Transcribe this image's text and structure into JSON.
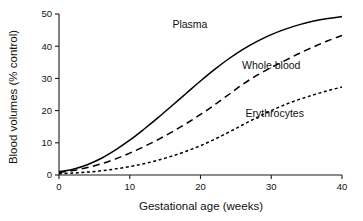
{
  "chart_data": {
    "type": "line",
    "title": "",
    "xlabel": "Gestational age (weeks)",
    "ylabel": "Blood volumes (% control)",
    "xlim": [
      0,
      40
    ],
    "ylim": [
      0,
      50
    ],
    "grid": false,
    "legend_position": "inline-annotations",
    "xticks": [
      "0",
      "10",
      "20",
      "30",
      "40"
    ],
    "xtick_values": [
      0,
      10,
      20,
      30,
      40
    ],
    "yticks": [
      "0",
      "10",
      "20",
      "30",
      "40",
      "50"
    ],
    "ytick_values": [
      0,
      10,
      20,
      30,
      40,
      50
    ],
    "x": [
      0,
      2,
      4,
      6,
      8,
      10,
      12,
      14,
      16,
      18,
      20,
      22,
      24,
      26,
      28,
      30,
      32,
      34,
      36,
      38,
      40
    ],
    "series": [
      {
        "name": "Plasma",
        "style": "solid",
        "values": [
          1.0,
          1.8,
          3.2,
          5.2,
          7.8,
          10.8,
          14.2,
          17.8,
          21.6,
          25.4,
          29.2,
          32.8,
          36.1,
          39.0,
          41.5,
          43.6,
          45.3,
          46.7,
          47.8,
          48.6,
          49.2
        ],
        "label_position": {
          "x": 18.5,
          "y": 45.5
        }
      },
      {
        "name": "Whole blood",
        "style": "dashed",
        "values": [
          0.8,
          1.4,
          2.3,
          3.5,
          5.0,
          6.8,
          8.8,
          11.0,
          13.4,
          16.0,
          18.8,
          21.8,
          25.0,
          28.2,
          31.0,
          33.4,
          35.6,
          37.8,
          39.8,
          41.7,
          43.3
        ],
        "label_position": {
          "x": 30.0,
          "y": 33.0
        }
      },
      {
        "name": "Erythrocytes",
        "style": "dotted",
        "values": [
          0.4,
          0.6,
          0.9,
          1.3,
          1.9,
          2.6,
          3.5,
          4.6,
          5.9,
          7.4,
          9.1,
          11.1,
          13.3,
          15.6,
          17.9,
          20.0,
          21.9,
          23.5,
          24.9,
          26.2,
          27.3
        ],
        "label_position": {
          "x": 30.5,
          "y": 18.0
        }
      }
    ]
  },
  "axes": {
    "x_title": "Gestational age (weeks)",
    "y_title": "Blood volumes (% control)",
    "x_ticks": [
      "0",
      "10",
      "20",
      "30",
      "40"
    ],
    "y_ticks": [
      "0",
      "10",
      "20",
      "30",
      "40",
      "50"
    ]
  },
  "labels": {
    "plasma": "Plasma",
    "whole_blood": "Whole blood",
    "erythrocytes": "Erythrocytes"
  },
  "colors": {
    "line": "#000000",
    "axis": "#1a1a1a",
    "background": "#ffffff"
  }
}
